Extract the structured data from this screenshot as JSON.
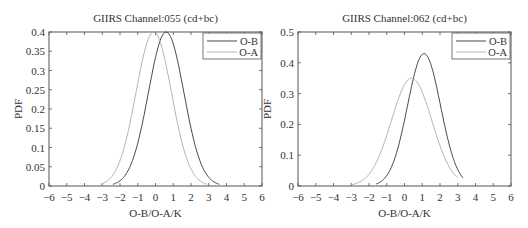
{
  "chart_data": [
    {
      "type": "line",
      "title": "GIIRS Channel:055  (cd+bc)",
      "xlabel": "O-B/O-A/K",
      "ylabel": "PDF",
      "xlim": [
        -6,
        6
      ],
      "ylim": [
        0,
        0.4
      ],
      "xticks": [
        -6,
        -5,
        -4,
        -3,
        -2,
        -1,
        0,
        1,
        2,
        3,
        4,
        5,
        6
      ],
      "yticks": [
        0,
        0.05,
        0.1,
        0.15,
        0.2,
        0.25,
        0.3,
        0.35,
        0.4
      ],
      "ytick_labels": [
        "0",
        "0.05",
        "0.1",
        "0.15",
        "0.2",
        "0.25",
        "0.3",
        "0.35",
        "0.4"
      ],
      "legend": {
        "position": "upper right",
        "entries": [
          "O-B",
          "O-A"
        ]
      },
      "grid": false,
      "series": [
        {
          "name": "O-B",
          "mean": 0.6,
          "sigma": 1.0,
          "peak": 0.4,
          "x_range": [
            -2.4,
            3.6
          ],
          "color": "#333333"
        },
        {
          "name": "O-A",
          "mean": -0.1,
          "sigma": 1.0,
          "peak": 0.4,
          "x_range": [
            -3.1,
            2.9
          ],
          "color": "#aaaaaa"
        }
      ]
    },
    {
      "type": "line",
      "title": "GIIRS Channel:062  (cd+bc)",
      "xlabel": "O-B/O-A/K",
      "ylabel": "PDF",
      "xlim": [
        -6,
        6
      ],
      "ylim": [
        0,
        0.5
      ],
      "xticks": [
        -6,
        -5,
        -4,
        -3,
        -2,
        -1,
        0,
        1,
        2,
        3,
        4,
        5,
        6
      ],
      "yticks": [
        0,
        0.1,
        0.2,
        0.3,
        0.4,
        0.5
      ],
      "ytick_labels": [
        "0",
        "0.1",
        "0.2",
        "0.3",
        "0.4",
        "0.5"
      ],
      "legend": {
        "position": "upper right",
        "entries": [
          "O-B",
          "O-A"
        ]
      },
      "grid": false,
      "series": [
        {
          "name": "O-B",
          "mean": 1.1,
          "sigma": 0.93,
          "peak": 0.43,
          "x_range": [
            -1.6,
            3.3
          ],
          "color": "#333333"
        },
        {
          "name": "O-A",
          "mean": 0.4,
          "sigma": 1.14,
          "peak": 0.35,
          "x_range": [
            -3.0,
            3.0
          ],
          "color": "#aaaaaa"
        }
      ]
    }
  ],
  "charts_layout": [
    {
      "left": 49,
      "right": 262,
      "top": 32,
      "bottom": 186
    },
    {
      "left": 298,
      "right": 511,
      "top": 32,
      "bottom": 186
    }
  ]
}
